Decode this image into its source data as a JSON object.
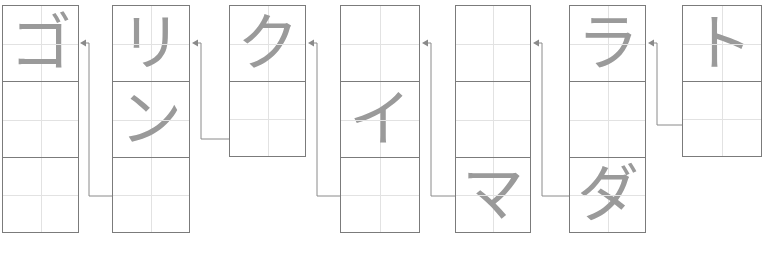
{
  "app": {
    "title": "Japanese Katakana Writing Practice Grid",
    "reading_order": "right-to-left",
    "background_color": "#ffffff",
    "grid_line_color": "#7b7b7b",
    "guide_line_color": "#e2e2e2",
    "glyph_color": "#9a9a9a",
    "arrow_color": "#8a8a8a"
  },
  "columns": [
    {
      "index": 1,
      "name": "column-1",
      "x": 2,
      "y": 5,
      "width": 77,
      "cell_height": 76,
      "cells": 3,
      "characters": [
        "ゴ",
        "",
        ""
      ]
    },
    {
      "index": 2,
      "name": "column-2",
      "x": 112,
      "y": 5,
      "width": 78,
      "cell_height": 76,
      "cells": 3,
      "characters": [
        "リ",
        "ン",
        ""
      ]
    },
    {
      "index": 3,
      "name": "column-3",
      "x": 229,
      "y": 5,
      "width": 77,
      "cell_height": 76,
      "cells": 2,
      "characters": [
        "ク",
        ""
      ]
    },
    {
      "index": 4,
      "name": "column-4",
      "x": 340,
      "y": 5,
      "width": 80,
      "cell_height": 76,
      "cells": 3,
      "characters": [
        "",
        "イ",
        ""
      ]
    },
    {
      "index": 5,
      "name": "column-5",
      "x": 455,
      "y": 5,
      "width": 76,
      "cell_height": 76,
      "cells": 3,
      "characters": [
        "",
        "",
        "マ"
      ]
    },
    {
      "index": 6,
      "name": "column-6",
      "x": 569,
      "y": 5,
      "width": 77,
      "cell_height": 76,
      "cells": 3,
      "characters": [
        "ラ",
        "",
        "ダ"
      ]
    },
    {
      "index": 7,
      "name": "column-7",
      "x": 682,
      "y": 5,
      "width": 80,
      "cell_height": 76,
      "cells": 2,
      "characters": [
        "ト",
        ""
      ]
    }
  ],
  "connectors": [
    {
      "name": "arrow-col2-to-col1",
      "from_column": 2,
      "to_column": 1,
      "start_x": 112,
      "start_y": 196,
      "corner_x": 89,
      "arrow_x": 80,
      "arrow_y": 43
    },
    {
      "name": "arrow-col3-to-col2",
      "from_column": 3,
      "to_column": 2,
      "start_x": 229,
      "start_y": 139,
      "corner_x": 201,
      "arrow_x": 192,
      "arrow_y": 43
    },
    {
      "name": "arrow-col4-to-col3",
      "from_column": 4,
      "to_column": 3,
      "start_x": 340,
      "start_y": 196,
      "corner_x": 317,
      "arrow_x": 308,
      "arrow_y": 43
    },
    {
      "name": "arrow-col5-to-col4",
      "from_column": 5,
      "to_column": 4,
      "start_x": 455,
      "start_y": 196,
      "corner_x": 431,
      "arrow_x": 422,
      "arrow_y": 43
    },
    {
      "name": "arrow-col6-to-col5",
      "from_column": 6,
      "to_column": 5,
      "start_x": 569,
      "start_y": 196,
      "corner_x": 542,
      "arrow_x": 533,
      "arrow_y": 43
    },
    {
      "name": "arrow-col7-to-col6",
      "from_column": 7,
      "to_column": 6,
      "start_x": 682,
      "start_y": 125,
      "corner_x": 657,
      "arrow_x": 648,
      "arrow_y": 43
    }
  ]
}
